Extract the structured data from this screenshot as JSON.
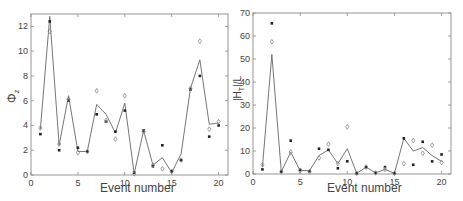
{
  "chart_data": [
    {
      "type": "line",
      "panel": "left",
      "title": "",
      "xlabel": "Event number",
      "ylabel": "Φ_z",
      "xlim": [
        0,
        21
      ],
      "ylim": [
        0,
        13
      ],
      "xticks": [
        0,
        5,
        10,
        15,
        20
      ],
      "yticks": [
        0,
        2,
        4,
        6,
        8,
        10,
        12
      ],
      "grid": false,
      "legend": null,
      "x": [
        1,
        2,
        3,
        4,
        5,
        6,
        7,
        8,
        9,
        10,
        11,
        12,
        13,
        14,
        15,
        16,
        17,
        18,
        19,
        20
      ],
      "series": [
        {
          "name": "line",
          "style": "solid line",
          "values": [
            3.7,
            12.8,
            2.4,
            6.4,
            1.9,
            1.9,
            5.7,
            4.9,
            3.4,
            5.8,
            0.1,
            3.6,
            0.8,
            1.4,
            0.2,
            1.7,
            7.0,
            9.3,
            4.1,
            4.2
          ]
        },
        {
          "name": "dots",
          "style": "filled dot",
          "values": [
            3.3,
            12.4,
            2.0,
            6.0,
            2.2,
            1.9,
            4.9,
            4.3,
            3.5,
            5.2,
            0.2,
            3.6,
            0.7,
            2.4,
            0.3,
            1.2,
            6.9,
            8.0,
            3.1,
            4.0
          ]
        },
        {
          "name": "diamonds",
          "style": "open diamond",
          "values": [
            3.8,
            11.6,
            2.5,
            6.1,
            1.8,
            1.9,
            6.8,
            4.4,
            2.9,
            6.4,
            0.1,
            3.5,
            0.8,
            0.5,
            0.3,
            1.2,
            7.0,
            10.8,
            3.7,
            4.3
          ]
        }
      ]
    },
    {
      "type": "line",
      "panel": "right",
      "title": "",
      "xlabel": "Event number",
      "ylabel": "|H_T|/L",
      "xlim": [
        0,
        21
      ],
      "ylim": [
        0,
        70
      ],
      "xticks": [
        0,
        5,
        10,
        15,
        20
      ],
      "yticks": [
        0,
        10,
        20,
        30,
        40,
        50,
        60,
        70
      ],
      "grid": false,
      "legend": null,
      "x": [
        1,
        2,
        3,
        4,
        5,
        6,
        7,
        8,
        9,
        10,
        11,
        12,
        13,
        14,
        15,
        16,
        17,
        18,
        19,
        20
      ],
      "series": [
        {
          "name": "line",
          "style": "solid line",
          "values": [
            3,
            52,
            1,
            9.5,
            1.5,
            1.5,
            8,
            10.5,
            4.5,
            11,
            0.3,
            3,
            0.5,
            2,
            0.3,
            15.5,
            10,
            11.5,
            8,
            5.5
          ]
        },
        {
          "name": "dots",
          "style": "filled dot",
          "values": [
            2,
            65.5,
            1,
            14.5,
            1.8,
            1.2,
            11,
            10.5,
            2.5,
            5.5,
            0.3,
            3,
            0.5,
            3,
            0.3,
            15.5,
            4,
            14,
            5.5,
            8.5
          ]
        },
        {
          "name": "diamonds",
          "style": "open diamond",
          "values": [
            4,
            57.5,
            1,
            9.5,
            1.5,
            1,
            7,
            13,
            4.5,
            20.5,
            0.3,
            3,
            0.5,
            2,
            0.3,
            4.5,
            14.5,
            9,
            12.5,
            5
          ]
        }
      ]
    }
  ],
  "left": {
    "xlabel": "Event number",
    "ylabel_main": "Φ",
    "ylabel_sub": "z",
    "xticklabels": [
      "0",
      "5",
      "10",
      "15",
      "20"
    ],
    "yticklabels": [
      "0",
      "2",
      "4",
      "6",
      "8",
      "10",
      "12"
    ]
  },
  "right": {
    "xlabel": "Event number",
    "ylabel": "|H",
    "ylabel_sub": "T",
    "ylabel_tail": "|/L",
    "xticklabels": [
      "0",
      "5",
      "10",
      "15",
      "20"
    ],
    "yticklabels": [
      "0",
      "10",
      "20",
      "30",
      "40",
      "50",
      "60",
      "70"
    ]
  }
}
